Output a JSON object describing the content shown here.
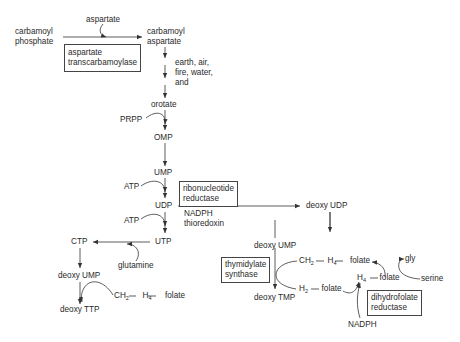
{
  "diagram": {
    "nodes": {
      "carbamoyl_phosphate": [
        "carbamoyl",
        "phosphate"
      ],
      "aspartate": "aspartate",
      "carbamoyl_aspartate": [
        "carbamoyl",
        "aspartate"
      ],
      "steps_note": [
        "earth, air,",
        "fire, water,",
        "and"
      ],
      "orotate": "orotate",
      "prpp": "PRPP",
      "omp": "OMP",
      "ump": "UMP",
      "atp_1": "ATP",
      "udp": "UDP",
      "atp_2": "ATP",
      "utp": "UTP",
      "ctp": "CTP",
      "glutamine": "glutamine",
      "deoxy_ump_left": "deoxy UMP",
      "deoxy_ttp": "deoxy TTP",
      "nadph_1": "NADPH",
      "thioredoxin": "thioredoxin",
      "deoxy_udp": "deoxy UDP",
      "deoxy_ump_right": "deoxy UMP",
      "deoxy_tmp": "deoxy TMP",
      "nadph_2": "NADPH",
      "gly": "gly",
      "serine": "serine"
    },
    "cofactors": {
      "ch2_h4_folate_left": {
        "a": "CH",
        "a_sub": "2",
        "b": "H",
        "b_sub": "4",
        "c": "folate"
      },
      "ch2_h4_folate_right": {
        "a": "CH",
        "a_sub": "2",
        "b": "H",
        "b_sub": "4",
        "c": "folate"
      },
      "h2_folate": {
        "a": "H",
        "a_sub": "2",
        "c": "folate"
      },
      "h4_folate": {
        "a": "H",
        "a_sub": "4",
        "c": "folate"
      }
    },
    "enzymes": {
      "aspartate_transcarbamoylase": [
        "aspartate",
        "transcarbamoylase"
      ],
      "ribonucleotide_reductase": [
        "ribonucleotide",
        "reductase"
      ],
      "thymidylate_synthase": [
        "thymidylate",
        "synthase"
      ],
      "dihydrofolate_reductase": [
        "dihydrofolate",
        "reductase"
      ]
    },
    "colors": {
      "line": "#333333",
      "text": "#2a2a2a",
      "box_border": "#444444",
      "background": "#ffffff"
    }
  }
}
